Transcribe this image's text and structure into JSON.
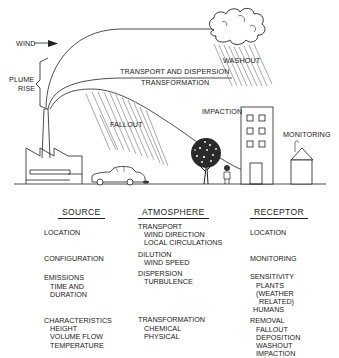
{
  "diagram": {
    "scene_labels": {
      "wind": "WIND",
      "plume_rise_line1": "PLUME",
      "plume_rise_line2": "RISE",
      "transport_dispersion": "TRANSPORT AND DISPERSION",
      "transformation": "TRANSFORMATION",
      "washout": "WASHOUT",
      "fallout": "FALLOUT",
      "impaction": "IMPACTION",
      "monitoring": "MONITORING"
    },
    "scene_elements": [
      "factory",
      "smokestack",
      "plume",
      "cloud",
      "rain",
      "car",
      "tree",
      "person",
      "building",
      "house"
    ],
    "columns": [
      {
        "heading": "SOURCE",
        "groups": [
          {
            "title": "LOCATION",
            "items": []
          },
          {
            "title": "CONFIGURATION",
            "items": []
          },
          {
            "title": "EMISSIONS",
            "items": [
              "TIME AND",
              "DURATION"
            ]
          },
          {
            "title": "CHARACTERISTICS",
            "items": [
              "HEIGHT",
              "VOLUME FLOW",
              "TEMPERATURE"
            ]
          }
        ]
      },
      {
        "heading": "ATMOSPHERE",
        "groups": [
          {
            "title": "TRANSPORT",
            "items": [
              "WIND DIRECTION",
              "LOCAL CIRCULATIONS"
            ]
          },
          {
            "title": "DILUTION",
            "items": [
              "WIND SPEED"
            ]
          },
          {
            "title": "DISPERSION",
            "items": [
              "TURBULENCE"
            ]
          },
          {
            "title": "TRANSFORMATION",
            "items": [
              "CHEMICAL",
              "PHYSICAL"
            ]
          }
        ]
      },
      {
        "heading": "RECEPTOR",
        "groups": [
          {
            "title": "LOCATION",
            "items": []
          },
          {
            "title": "MONITORING",
            "items": []
          },
          {
            "title": "SENSITIVITY",
            "items": [
              "PLANTS",
              "(WEATHER",
              "RELATED)",
              "HUMANS"
            ]
          },
          {
            "title": "REMOVAL",
            "items": [
              "FALLOUT",
              "DEPOSITION",
              "WASHOUT",
              "IMPACTION"
            ]
          }
        ]
      }
    ]
  }
}
